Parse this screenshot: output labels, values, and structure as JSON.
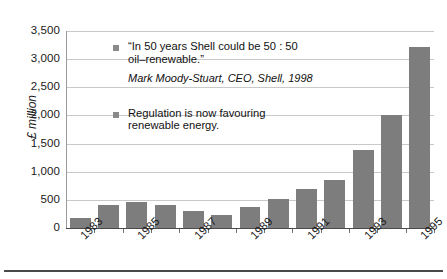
{
  "chart_data": {
    "type": "bar",
    "title": "",
    "subtitle": "",
    "xlabel": "",
    "ylabel": "£ million",
    "ylim": [
      0,
      3500
    ],
    "ytick_values": [
      0,
      500,
      1000,
      1500,
      2000,
      2500,
      3000,
      3500
    ],
    "ytick_labels": [
      "0",
      "500",
      "1,000",
      "1,500",
      "2,000",
      "2,500",
      "3,000",
      "3,500"
    ],
    "grid": true,
    "legend": "none",
    "bar_color": "#7d7d7d",
    "categories": [
      "1983",
      "1984",
      "1985",
      "1986",
      "1987",
      "1988",
      "1989",
      "1990",
      "1991",
      "1992",
      "1993",
      "1994",
      "1995"
    ],
    "xtick_labels_shown": [
      "1983",
      "1985",
      "1987",
      "1989",
      "1991",
      "1993",
      "1995"
    ],
    "values": [
      175,
      410,
      470,
      410,
      305,
      235,
      370,
      510,
      690,
      860,
      1380,
      2005,
      3210
    ],
    "annotations": [
      {
        "bullet": "square",
        "open_quote": "“",
        "text": "In 50 years Shell could be 50 : 50 oil–renewable.",
        "close_quote": "”",
        "attribution": "Mark Moody-Stuart, CEO, Shell, 1998"
      },
      {
        "bullet": "square",
        "text": "Regulation is now favouring renewable energy."
      }
    ]
  },
  "axis": {
    "y_label": "£ million"
  },
  "annotation_1": {
    "open_quote": "“",
    "line1": "In 50 years Shell could be 50 : 50",
    "line2": "oil–renewable.",
    "close_quote": "”",
    "attribution": "Mark Moody-Stuart, CEO, Shell, 1998"
  },
  "annotation_2": {
    "line1": "Regulation is now favouring",
    "line2": "renewable energy."
  }
}
